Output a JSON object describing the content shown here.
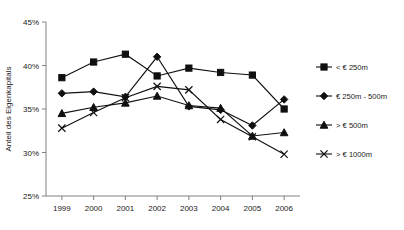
{
  "chart_data": {
    "type": "line",
    "title": "",
    "xlabel": "",
    "ylabel": "Anteil des Eigenkapitals",
    "categories": [
      "1999",
      "2000",
      "2001",
      "2002",
      "2003",
      "2004",
      "2005",
      "2006"
    ],
    "ylim": [
      25,
      45
    ],
    "ytick_labels": [
      "45%",
      "40%",
      "35%",
      "30%",
      "25%"
    ],
    "ytick_values": [
      45,
      40,
      35,
      30,
      25
    ],
    "ytick_suffix": "%",
    "grid": false,
    "legend_position": "right",
    "series": [
      {
        "name": "< € 250m",
        "marker": "square",
        "values": [
          38.6,
          40.4,
          41.3,
          38.8,
          39.7,
          39.2,
          38.9,
          35.0
        ]
      },
      {
        "name": "€ 250m - 500m",
        "marker": "diamond",
        "values": [
          36.8,
          37.0,
          36.4,
          41.0,
          35.3,
          34.9,
          33.1,
          36.1
        ]
      },
      {
        "name": "> € 500m",
        "marker": "triangle",
        "values": [
          34.5,
          35.2,
          35.7,
          36.5,
          35.4,
          35.1,
          31.9,
          32.3
        ]
      },
      {
        "name": "> € 1000m",
        "marker": "cross",
        "values": [
          32.8,
          34.6,
          36.3,
          37.6,
          37.2,
          33.8,
          31.8,
          29.8
        ]
      }
    ]
  },
  "colors": {
    "ink": "#101010",
    "axis": "#808080",
    "background": "#ffffff"
  }
}
